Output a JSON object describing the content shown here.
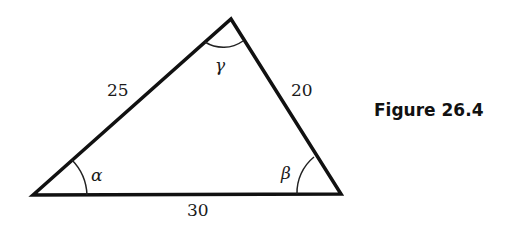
{
  "figure": {
    "caption": "Figure 26.4",
    "type": "triangle",
    "sides": {
      "left": "25",
      "right": "20",
      "bottom": "30"
    },
    "angles": {
      "bottom_left": "α",
      "bottom_right": "β",
      "top": "γ"
    }
  }
}
